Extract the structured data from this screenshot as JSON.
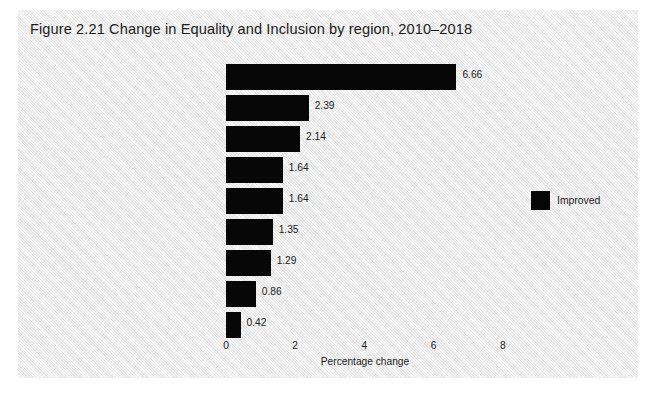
{
  "figure": {
    "title": "Figure 2.21   Change in Equality and Inclusion by region, 2010–2018",
    "panel_color": "#ebebeb",
    "bar_color": "#070707",
    "text_color": "#1c1c1c"
  },
  "legend": {
    "position": "right",
    "entries": [
      {
        "label": "Improved",
        "color": "#070707"
      }
    ],
    "improved_label": "Improved"
  },
  "chart_data": {
    "type": "bar",
    "orientation": "horizontal",
    "title": "Figure 2.21   Change in Equality and Inclusion by region, 2010–2018",
    "xlabel": "Percentage change",
    "ylabel": "",
    "xlim": [
      0,
      8.6
    ],
    "xticks": [
      0,
      2,
      4,
      6,
      8
    ],
    "xtick_labels": [
      "0",
      "2",
      "4",
      "6",
      "8"
    ],
    "grid": false,
    "legend_position": "right",
    "series_name": "Improved",
    "categories": [
      "South Asia",
      "Sub-Saharan Africa",
      "Asia-Pacific",
      "MENA",
      "Europe",
      "Central America and Caribbean",
      "Russia and Eurasia",
      "South America",
      "North America"
    ],
    "values": [
      6.66,
      2.39,
      2.14,
      1.64,
      1.64,
      1.35,
      1.29,
      0.86,
      0.42
    ],
    "value_labels": [
      "6.66",
      "2.39",
      "2.14",
      "1.64",
      "1.64",
      "1.35",
      "1.29",
      "0.86",
      "0.42"
    ]
  }
}
